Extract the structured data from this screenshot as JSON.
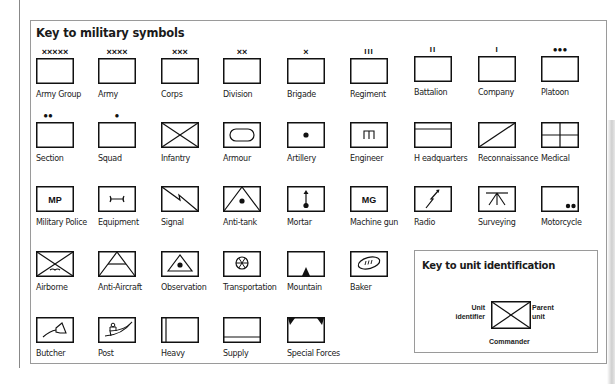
{
  "title": "Key to military symbols",
  "symbols": [
    {
      "label": "Army Group",
      "mark": "×××××"
    },
    {
      "label": "Army",
      "mark": "××××"
    },
    {
      "label": "Corps",
      "mark": "×××"
    },
    {
      "label": "Division",
      "mark": "××"
    },
    {
      "label": "Brigade",
      "mark": "×"
    },
    {
      "label": "Regiment",
      "mark": "III"
    },
    {
      "label": "Battalion",
      "mark": "II"
    },
    {
      "label": "Company",
      "mark": "I"
    },
    {
      "label": "Platoon",
      "mark": "●●●"
    },
    {
      "label": "Section",
      "mark": "●●"
    },
    {
      "label": "Squad",
      "mark": "●"
    },
    {
      "label": "Infantry",
      "mark": ""
    },
    {
      "label": "Armour",
      "mark": ""
    },
    {
      "label": "Artillery",
      "mark": ""
    },
    {
      "label": "Engineer",
      "mark": ""
    },
    {
      "label": "H eadquarters",
      "mark": ""
    },
    {
      "label": "Reconnaissance",
      "mark": ""
    },
    {
      "label": "Medical",
      "mark": ""
    },
    {
      "label": "Military Police",
      "mark": "",
      "inner_text": "MP"
    },
    {
      "label": "Equipment",
      "mark": ""
    },
    {
      "label": "Signal",
      "mark": ""
    },
    {
      "label": "Anti-tank",
      "mark": ""
    },
    {
      "label": "Mortar",
      "mark": ""
    },
    {
      "label": "Machine gun",
      "mark": "",
      "inner_text": "MG"
    },
    {
      "label": "Radio",
      "mark": ""
    },
    {
      "label": "Surveying",
      "mark": ""
    },
    {
      "label": "Motorcycle",
      "mark": ""
    },
    {
      "label": "Airborne",
      "mark": ""
    },
    {
      "label": "Anti-Aircraft",
      "mark": ""
    },
    {
      "label": "Observation",
      "mark": ""
    },
    {
      "label": "Transportation",
      "mark": ""
    },
    {
      "label": "Mountain",
      "mark": ""
    },
    {
      "label": "Baker",
      "mark": ""
    },
    {
      "label": "Butcher",
      "mark": ""
    },
    {
      "label": "Post",
      "mark": ""
    },
    {
      "label": "Heavy",
      "mark": ""
    },
    {
      "label": "Supply",
      "mark": ""
    },
    {
      "label": "Special Forces",
      "mark": ""
    }
  ],
  "unit_key": {
    "title": "Key to unit identification",
    "left_label_1": "Unit",
    "left_label_2": "identifier",
    "right_label_1": "Parent",
    "right_label_2": "unit",
    "bottom_label": "Commander"
  }
}
